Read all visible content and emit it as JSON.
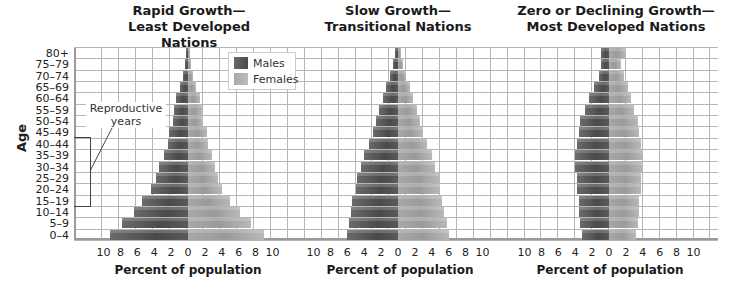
{
  "chart_data": [
    {
      "type": "bar",
      "subtype": "population-pyramid",
      "title": "Rapid Growth— Least Developed Nations",
      "title_lines": [
        "Rapid Growth—",
        "Least Developed Nations"
      ],
      "xlabel": "Percent of population",
      "ylabel": "Age",
      "xticks": [
        "10",
        "8",
        "6",
        "4",
        "2",
        "0",
        "2",
        "4",
        "6",
        "8",
        "10"
      ],
      "xlim": [
        -10,
        10
      ],
      "grid": true,
      "categories": [
        "0–4",
        "5–9",
        "10–14",
        "15–19",
        "20–24",
        "25–29",
        "30–34",
        "35–39",
        "40–44",
        "45–49",
        "50–54",
        "55–59",
        "60–64",
        "65–69",
        "70–74",
        "75–79",
        "80+"
      ],
      "series": [
        {
          "name": "Males",
          "values": [
            9.2,
            7.8,
            6.4,
            5.4,
            4.4,
            3.8,
            3.4,
            2.8,
            2.4,
            2.2,
            1.8,
            1.6,
            1.4,
            1.0,
            0.6,
            0.4,
            0.2
          ]
        },
        {
          "name": "Females",
          "values": [
            9.0,
            7.4,
            6.2,
            5.0,
            4.0,
            3.6,
            3.2,
            2.8,
            2.4,
            2.2,
            1.8,
            1.6,
            1.4,
            1.0,
            0.6,
            0.4,
            0.2
          ]
        }
      ],
      "legend": [
        "Males",
        "Females"
      ],
      "legend_position": "upper right",
      "annotations": [
        {
          "text": "Reproductive years",
          "lines": [
            "Reproductive",
            "years"
          ],
          "span": [
            "15–19",
            "45–49"
          ]
        }
      ]
    },
    {
      "type": "bar",
      "subtype": "population-pyramid",
      "title": "Slow Growth— Transitional Nations",
      "title_lines": [
        "Slow Growth—",
        "Transitional Nations"
      ],
      "xlabel": "Percent of population",
      "xticks": [
        "10",
        "8",
        "6",
        "4",
        "2",
        "0",
        "2",
        "4",
        "6",
        "8",
        "10"
      ],
      "xlim": [
        -10,
        10
      ],
      "grid": true,
      "categories": [
        "0–4",
        "5–9",
        "10–14",
        "15–19",
        "20–24",
        "25–29",
        "30–34",
        "35–39",
        "40–44",
        "45–49",
        "50–54",
        "55–59",
        "60–64",
        "65–69",
        "70–74",
        "75–79",
        "80+"
      ],
      "series": [
        {
          "name": "Males",
          "values": [
            6.0,
            5.8,
            5.6,
            5.4,
            5.0,
            4.8,
            4.4,
            4.0,
            3.4,
            3.0,
            2.6,
            2.2,
            1.8,
            1.4,
            1.0,
            0.6,
            0.3
          ]
        },
        {
          "name": "Females",
          "values": [
            6.0,
            5.8,
            5.4,
            5.2,
            5.0,
            4.8,
            4.4,
            4.0,
            3.4,
            3.0,
            2.6,
            2.2,
            1.8,
            1.4,
            1.0,
            0.6,
            0.3
          ]
        }
      ]
    },
    {
      "type": "bar",
      "subtype": "population-pyramid",
      "title": "Zero or Declining Growth— Most Developed Nations",
      "title_lines": [
        "Zero or Declining Growth—",
        "Most Developed Nations"
      ],
      "xlabel": "Percent of population",
      "xticks": [
        "10",
        "8",
        "6",
        "4",
        "2",
        "0",
        "2",
        "4",
        "6",
        "8",
        "10"
      ],
      "xlim": [
        -10,
        10
      ],
      "grid": true,
      "categories": [
        "0–4",
        "5–9",
        "10–14",
        "15–19",
        "20–24",
        "25–29",
        "30–34",
        "35–39",
        "40–44",
        "45–49",
        "50–54",
        "55–59",
        "60–64",
        "65–69",
        "70–74",
        "75–79",
        "80+"
      ],
      "series": [
        {
          "name": "Males",
          "values": [
            3.2,
            3.4,
            3.6,
            3.6,
            3.8,
            3.8,
            4.0,
            4.0,
            3.8,
            3.6,
            3.4,
            2.8,
            2.4,
            1.8,
            1.2,
            0.9,
            1.0
          ]
        },
        {
          "name": "Females",
          "values": [
            3.2,
            3.4,
            3.6,
            3.6,
            3.8,
            3.8,
            4.0,
            4.0,
            3.8,
            3.6,
            3.4,
            3.0,
            2.6,
            2.2,
            1.8,
            1.4,
            2.0
          ]
        }
      ]
    }
  ],
  "labels": {
    "ylabel": "Age",
    "xlabel": "Percent of population",
    "legend_males": "Males",
    "legend_females": "Females",
    "annotation_line1": "Reproductive",
    "annotation_line2": "years"
  },
  "colors": {
    "males": "#555555",
    "females": "#a8a8a8",
    "grid": "#b5b5b5"
  }
}
